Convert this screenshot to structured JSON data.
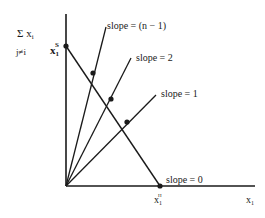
{
  "diagram": {
    "y_axis_label": {
      "sum": "Σ x",
      "sub": "i",
      "index": "j≠i"
    },
    "x_axis_label": {
      "main": "x",
      "sub": "1"
    },
    "point_top": {
      "main": "x",
      "sub": "1",
      "sup": "S"
    },
    "point_bottom": {
      "main": "x",
      "sub": "1",
      "sup": "H"
    },
    "rays": [
      {
        "label": "slope = (n − 1)"
      },
      {
        "label": "slope = 2"
      },
      {
        "label": "slope = 1"
      },
      {
        "label": "slope = 0"
      }
    ],
    "colors": {
      "ink": "#1a1a1a",
      "background": "#ffffff"
    }
  }
}
